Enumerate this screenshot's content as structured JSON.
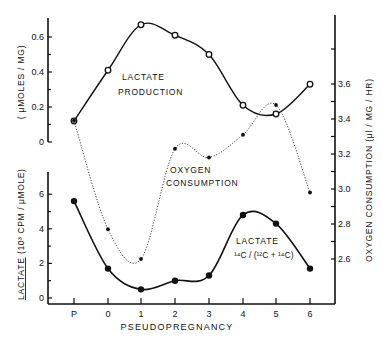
{
  "chart_data": {
    "type": "line",
    "title": "",
    "xlabel": "PSEUDOPREGNANCY",
    "categories": [
      "P",
      "0",
      "1",
      "2",
      "3",
      "4",
      "5",
      "6"
    ],
    "axes": {
      "left_upper": {
        "label": "( μMOLES / MG)",
        "ticks": [
          "0",
          "0.2",
          "0.4",
          "0.6"
        ],
        "range": [
          0,
          0.7
        ]
      },
      "left_lower": {
        "label_underlined": "LACTATE",
        "label": "(10³ CPM / μMOLE)",
        "ticks": [
          "0",
          "2",
          "4",
          "6"
        ],
        "range": [
          0,
          7
        ]
      },
      "right": {
        "label": "OXYGEN CONSUMPTION (μl / MG / HR)",
        "ticks": [
          "2.6",
          "2.8",
          "3.0",
          "3.2",
          "3.4",
          "3.6"
        ],
        "range": [
          2.5,
          3.9
        ]
      }
    },
    "series": [
      {
        "name": "LACTATE PRODUCTION",
        "axis": "left_upper",
        "style": "solid line, open circles",
        "values": [
          0.12,
          0.41,
          0.67,
          0.61,
          0.5,
          0.21,
          0.16,
          0.33
        ]
      },
      {
        "name": "OXYGEN CONSUMPTION",
        "axis": "right",
        "style": "dotted line, filled dots",
        "values": [
          3.39,
          2.77,
          2.6,
          3.23,
          3.18,
          3.31,
          3.48,
          2.98
        ]
      },
      {
        "name": "LACTATE 14C/(12C+14C)",
        "axis": "left_lower",
        "style": "solid line, filled circles",
        "values": [
          5.6,
          1.7,
          0.5,
          1.0,
          1.3,
          4.8,
          4.3,
          1.7
        ]
      }
    ],
    "annotations": [
      {
        "text": "LACTATE",
        "line2": "PRODUCTION"
      },
      {
        "text": "OXYGEN",
        "line2": "CONSUMPTION"
      },
      {
        "text": "LACTATE",
        "line2": "14C/(12C+14C)"
      }
    ],
    "grid": false,
    "legend": "inline labels"
  },
  "labels": {
    "x_axis": "PSEUDOPREGNANCY",
    "left_upper_axis": "( μMOLES / MG)",
    "left_lower_axis_main": "LACTATE",
    "left_lower_axis_units": "(10³ CPM / μMOLE)",
    "right_axis": "OXYGEN  CONSUMPTION  (μl / MG / HR)",
    "lp_line1": "LACTATE",
    "lp_line2": "PRODUCTION",
    "oc_line1": "OXYGEN",
    "oc_line2": "CONSUMPTION",
    "lr_line1": "LACTATE",
    "lr_line2": "¹⁴C / (¹²C + ¹⁴C)"
  }
}
